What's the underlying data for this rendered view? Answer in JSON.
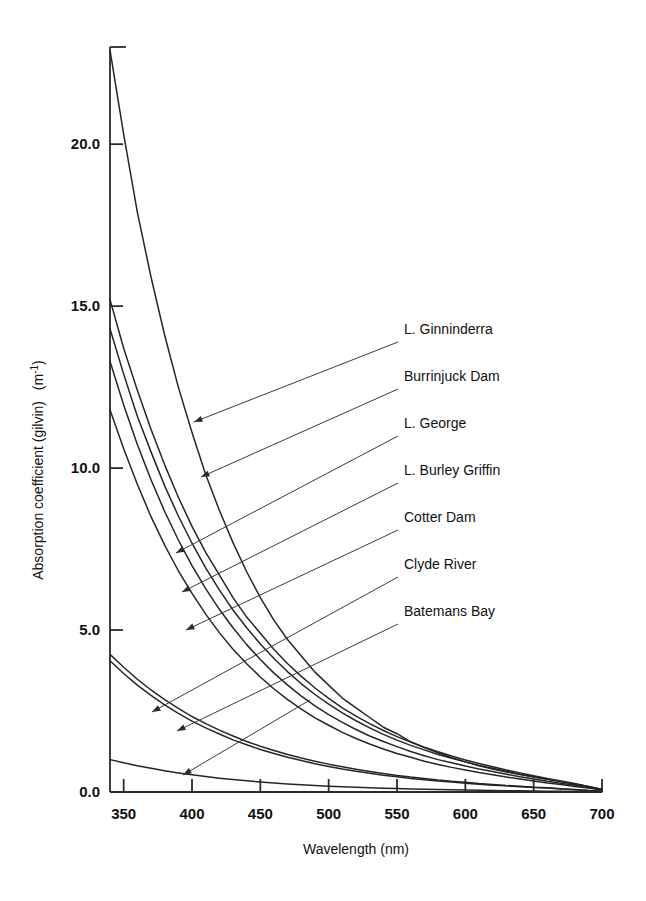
{
  "chart_data": {
    "type": "line",
    "title": "",
    "xlabel": "Wavelength (nm)",
    "ylabel": "Absorption coefficient (gilvin)  (m",
    "ylabel_sup": "-1",
    "ylabel_tail": ")",
    "xlim": [
      340,
      700
    ],
    "ylim": [
      0.0,
      23.0
    ],
    "xticks": [
      350,
      400,
      450,
      500,
      550,
      600,
      650,
      700
    ],
    "xtick_labels": [
      "350",
      "400",
      "450",
      "500",
      "550",
      "600",
      "650",
      "700"
    ],
    "yticks": [
      0.0,
      5.0,
      10.0,
      15.0,
      20.0
    ],
    "ytick_labels": [
      "0.0",
      "5.0",
      "10.0",
      "15.0",
      "20.0"
    ],
    "grid": false,
    "legend_position": "inside-right-leader-lines",
    "x": [
      340,
      350,
      360,
      370,
      380,
      390,
      400,
      410,
      420,
      430,
      440,
      450,
      460,
      470,
      480,
      490,
      500,
      510,
      520,
      530,
      540,
      550,
      560,
      570,
      580,
      590,
      600,
      610,
      620,
      630,
      640,
      650,
      660,
      670,
      680,
      690,
      700
    ],
    "series": [
      {
        "name": "L. Ginninderra",
        "values": [
          22.9,
          20.3,
          17.9,
          15.9,
          14.1,
          12.5,
          11.1,
          9.8,
          8.7,
          7.7,
          6.8,
          6.0,
          5.3,
          4.7,
          4.2,
          3.7,
          3.3,
          2.9,
          2.6,
          2.3,
          2.0,
          1.8,
          1.55,
          1.37,
          1.21,
          1.06,
          0.93,
          0.81,
          0.71,
          0.62,
          0.54,
          0.46,
          0.39,
          0.32,
          0.25,
          0.17,
          0.08
        ]
      },
      {
        "name": "Burrinjuck Dam",
        "values": [
          15.2,
          13.7,
          12.4,
          11.2,
          10.1,
          9.1,
          8.2,
          7.4,
          6.7,
          6.0,
          5.4,
          4.9,
          4.4,
          3.96,
          3.57,
          3.21,
          2.89,
          2.6,
          2.34,
          2.11,
          1.9,
          1.71,
          1.54,
          1.38,
          1.24,
          1.11,
          0.99,
          0.88,
          0.78,
          0.68,
          0.59,
          0.5,
          0.42,
          0.34,
          0.26,
          0.17,
          0.08
        ]
      },
      {
        "name": "L. George",
        "values": [
          14.3,
          12.9,
          11.6,
          10.5,
          9.45,
          8.52,
          7.68,
          6.92,
          6.24,
          5.62,
          5.07,
          4.57,
          4.12,
          3.71,
          3.34,
          3.01,
          2.71,
          2.44,
          2.2,
          1.98,
          1.78,
          1.6,
          1.44,
          1.3,
          1.16,
          1.04,
          0.93,
          0.82,
          0.73,
          0.64,
          0.55,
          0.47,
          0.39,
          0.32,
          0.24,
          0.16,
          0.08
        ]
      },
      {
        "name": "L. Burley Griffin",
        "values": [
          13.3,
          11.95,
          10.73,
          9.64,
          8.66,
          7.78,
          6.99,
          6.28,
          5.64,
          5.07,
          4.55,
          4.09,
          3.67,
          3.3,
          2.96,
          2.66,
          2.39,
          2.15,
          1.93,
          1.73,
          1.56,
          1.4,
          1.25,
          1.12,
          1.0,
          0.9,
          0.8,
          0.71,
          0.63,
          0.55,
          0.47,
          0.4,
          0.33,
          0.27,
          0.21,
          0.14,
          0.07
        ]
      },
      {
        "name": "Cotter Dam",
        "values": [
          11.8,
          10.6,
          9.5,
          8.5,
          7.62,
          6.83,
          6.13,
          5.49,
          4.92,
          4.41,
          3.96,
          3.55,
          3.18,
          2.85,
          2.56,
          2.29,
          2.06,
          1.84,
          1.65,
          1.48,
          1.33,
          1.19,
          1.07,
          0.95,
          0.85,
          0.76,
          0.68,
          0.6,
          0.53,
          0.46,
          0.4,
          0.34,
          0.28,
          0.23,
          0.17,
          0.12,
          0.06
        ]
      },
      {
        "name": "Clyde River",
        "values": [
          4.25,
          3.85,
          3.48,
          3.15,
          2.85,
          2.58,
          2.33,
          2.11,
          1.91,
          1.73,
          1.56,
          1.41,
          1.28,
          1.16,
          1.05,
          0.95,
          0.86,
          0.78,
          0.7,
          0.63,
          0.57,
          0.51,
          0.46,
          0.42,
          0.37,
          0.33,
          0.3,
          0.26,
          0.23,
          0.2,
          0.18,
          0.15,
          0.13,
          0.1,
          0.08,
          0.05,
          0.03
        ]
      },
      {
        "name": "Batemans Bay",
        "values": [
          4.05,
          3.66,
          3.3,
          2.98,
          2.69,
          2.43,
          2.19,
          1.98,
          1.79,
          1.61,
          1.46,
          1.31,
          1.19,
          1.07,
          0.97,
          0.87,
          0.79,
          0.71,
          0.64,
          0.58,
          0.52,
          0.47,
          0.42,
          0.38,
          0.34,
          0.31,
          0.27,
          0.24,
          0.21,
          0.19,
          0.16,
          0.14,
          0.12,
          0.09,
          0.07,
          0.05,
          0.025
        ]
      },
      {
        "name": "Seawater baseline",
        "values": [
          1.0,
          0.9,
          0.81,
          0.73,
          0.655,
          0.59,
          0.53,
          0.475,
          0.427,
          0.384,
          0.345,
          0.31,
          0.278,
          0.25,
          0.224,
          0.201,
          0.18,
          0.162,
          0.145,
          0.13,
          0.117,
          0.105,
          0.094,
          0.084,
          0.075,
          0.067,
          0.06,
          0.054,
          0.048,
          0.042,
          0.037,
          0.032,
          0.027,
          0.022,
          0.016,
          0.01,
          0.004
        ]
      }
    ],
    "annotations": [
      {
        "label": "L. Ginninderra",
        "text_x": 404,
        "text_y": 334,
        "leader_from_x": 398,
        "leader_from_y": 342,
        "arrow_x": 194,
        "arrow_y": 422
      },
      {
        "label": "Burrinjuck Dam",
        "text_x": 404,
        "text_y": 381,
        "leader_from_x": 398,
        "leader_from_y": 389,
        "arrow_x": 201,
        "arrow_y": 477
      },
      {
        "label": "L. George",
        "text_x": 404,
        "text_y": 428,
        "leader_from_x": 398,
        "leader_from_y": 436,
        "arrow_x": 176,
        "arrow_y": 553
      },
      {
        "label": "L. Burley Griffin",
        "text_x": 404,
        "text_y": 475,
        "leader_from_x": 398,
        "leader_from_y": 483,
        "arrow_x": 182,
        "arrow_y": 592
      },
      {
        "label": "Cotter Dam",
        "text_x": 404,
        "text_y": 522,
        "leader_from_x": 398,
        "leader_from_y": 530,
        "arrow_x": 186,
        "arrow_y": 630
      },
      {
        "label": "Clyde River",
        "text_x": 404,
        "text_y": 569,
        "leader_from_x": 398,
        "leader_from_y": 577,
        "arrow_x": 152,
        "arrow_y": 712
      },
      {
        "label": "Batemans Bay",
        "text_x": 404,
        "text_y": 616,
        "leader_from_x": 398,
        "leader_from_y": 624,
        "arrow_x": 177,
        "arrow_y": 731
      },
      {
        "label": "Seawater leader",
        "text_x": 404,
        "text_y": 616,
        "leader_from_x": 310,
        "leader_from_y": 700,
        "arrow_x": 183,
        "arrow_y": 775
      }
    ]
  },
  "axes": {
    "x_axis_title": "Wavelength (nm)",
    "y_axis_title_main": "Absorption coefficient (gilvin)",
    "y_axis_title_unit_open": "(m",
    "y_axis_title_unit_sup": "-1",
    "y_axis_title_unit_close": ")"
  }
}
